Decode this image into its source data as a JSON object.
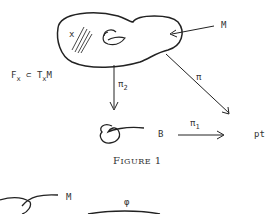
{
  "figure": {
    "caption_prefix": "F",
    "caption_rest": "IGURE",
    "caption_number": "1",
    "labels": {
      "manifold": "M",
      "point": "x",
      "fiber_relation_F": "F",
      "fiber_relation_sub1": "x",
      "fiber_relation_subset": "⊂ T",
      "fiber_relation_sub2": "x",
      "fiber_relation_M": "M",
      "pi": "π",
      "pi2": "π",
      "pi2_sub": "2",
      "base": "B",
      "pi1": "π",
      "pi1_sub": "1",
      "point_space": "pt"
    }
  },
  "next_figure": {
    "manifold": "M",
    "map": "φ"
  }
}
